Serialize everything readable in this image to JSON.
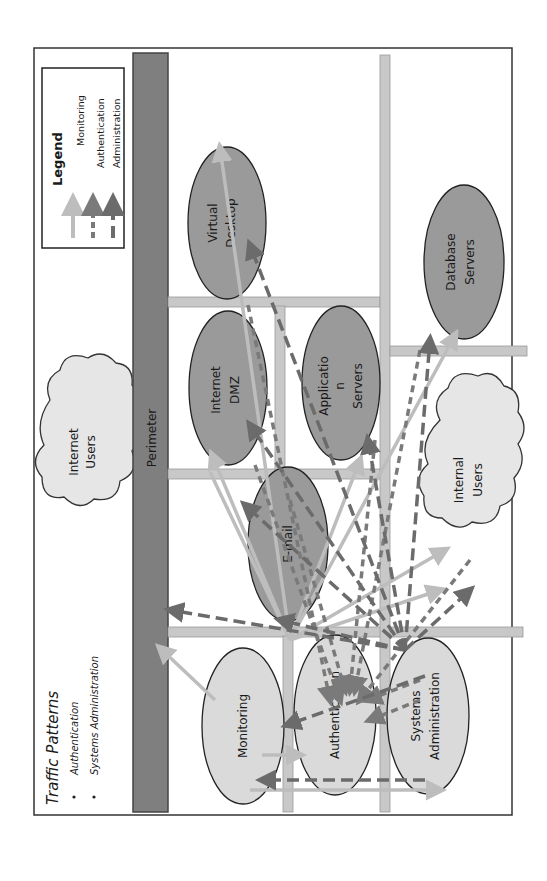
{
  "diagram": {
    "orientation": "rotated 90deg counter-clockwise",
    "title": "Traffic Patterns",
    "bullets": [
      "Authentication",
      "Systems Administration"
    ],
    "legend": {
      "title": "Legend",
      "items": [
        {
          "label": "Monitoring",
          "style": "solid-light-arrow",
          "color": "#b9b9b9"
        },
        {
          "label": "Authentication",
          "style": "dashed-arrow",
          "color": "#7a7a7a"
        },
        {
          "label": "Administration",
          "style": "long-dash-arrow",
          "color": "#6a6a6a"
        }
      ]
    },
    "perimeter": {
      "label": "Perimeter",
      "color": "#7f7f7f"
    },
    "clouds": {
      "internet_users": {
        "line1": "Internet",
        "line2": "Users"
      },
      "internal_users": {
        "line1": "Internal",
        "line2": "Users"
      }
    },
    "nodes": {
      "virtual_desktop": {
        "line1": "Virtual",
        "line2": "Desktop"
      },
      "internet_dmz": {
        "line1": "Internet",
        "line2": "DMZ"
      },
      "email": {
        "line1": "E-mail"
      },
      "application_servers": {
        "line1": "Applicatio",
        "line2": "n",
        "line3": "Servers"
      },
      "database_servers": {
        "line1": "Database",
        "line2": "Servers"
      },
      "monitoring": {
        "line1": "Monitoring"
      },
      "authentication": {
        "line1": "Authentication"
      },
      "systems_administration": {
        "line1": "Systems",
        "line2": "Administration"
      }
    },
    "colors": {
      "dark_node": "#9a9a9a",
      "light_node": "#d9d9d9",
      "cloud": "#e6e6e6",
      "grid_bar": "#c8c8c8",
      "monitoring_arrow": "#bdbdbd",
      "auth_arrow": "#7a7a7a",
      "admin_arrow": "#6b6b6b"
    }
  }
}
